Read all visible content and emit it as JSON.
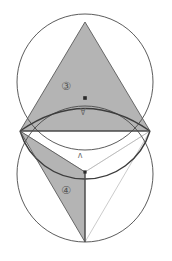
{
  "figure": {
    "canvas": {
      "width": 172,
      "height": 261
    },
    "colors": {
      "background": "#ffffff",
      "stroke": "#4a4a4a",
      "thin_stroke": "#9a9a9a",
      "fill_gray": "#b4b4b4",
      "fill_gray_dark": "#a8a8a8",
      "label": "#555555",
      "point": "#2b2b2b"
    },
    "circles": [
      {
        "name": "upper-circle",
        "cx": 85,
        "cy": 82,
        "r": 68
      },
      {
        "name": "lower-circle",
        "cx": 85,
        "cy": 174,
        "r": 68
      }
    ],
    "points": [
      {
        "name": "top-apex",
        "x": 85,
        "y": 22
      },
      {
        "name": "left-intersection",
        "x": 20,
        "y": 131
      },
      {
        "name": "right-intersection",
        "x": 150,
        "y": 131
      },
      {
        "name": "arc-top-point",
        "x": 85,
        "y": 98
      },
      {
        "name": "center-point",
        "x": 85,
        "y": 172
      },
      {
        "name": "bottom-vertex",
        "x": 85,
        "y": 242
      }
    ],
    "labels": [
      {
        "name": "upper-region-label",
        "text": "③",
        "x": 66,
        "y": 86,
        "style": "circled"
      },
      {
        "name": "upper-arc-label",
        "text": "Ɐ",
        "x": 83,
        "y": 113,
        "style": "plain"
      },
      {
        "name": "lower-arc-label",
        "text": "ʌ",
        "x": 80,
        "y": 156,
        "style": "plain"
      },
      {
        "name": "lower-region-label",
        "text": "④",
        "x": 66,
        "y": 190,
        "style": "circled"
      }
    ],
    "shapes": [
      {
        "name": "upper-triangle",
        "kind": "filled-triangle"
      },
      {
        "name": "upper-arc-segment",
        "kind": "arc"
      },
      {
        "name": "lower-left-lune",
        "kind": "filled-lune"
      },
      {
        "name": "lower-triangle",
        "kind": "filled-triangle"
      },
      {
        "name": "horizontal-chord",
        "kind": "line"
      },
      {
        "name": "construction-line-right-to-bottom",
        "kind": "thin-line"
      },
      {
        "name": "construction-line-right-to-center",
        "kind": "thin-line"
      },
      {
        "name": "construction-line-left-to-center",
        "kind": "thin-line"
      }
    ]
  }
}
